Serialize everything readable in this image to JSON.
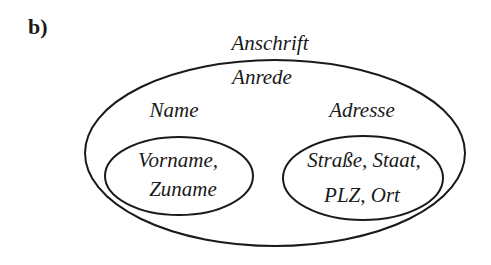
{
  "panel_label": "b)",
  "outer": {
    "title": "Anschrift",
    "inside_label": "Anrede"
  },
  "groups": [
    {
      "label": "Name",
      "contents_line1": "Vorname,",
      "contents_line2": "Zuname"
    },
    {
      "label": "Adresse",
      "contents_line1": "Straße, Staat,",
      "contents_line2": "PLZ, Ort"
    }
  ],
  "colors": {
    "stroke": "#1a1a1a",
    "background": "#ffffff"
  }
}
